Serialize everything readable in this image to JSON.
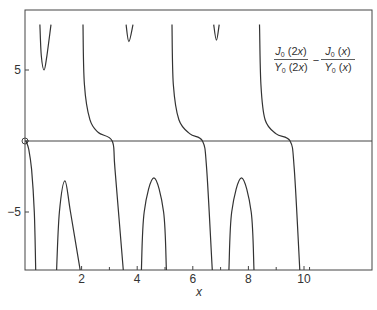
{
  "chart_data": {
    "type": "line",
    "title": "",
    "xlabel": "x",
    "ylabel": "",
    "xlim": [
      0,
      12.4
    ],
    "ylim": [
      -9.1,
      8.2
    ],
    "grid": false,
    "legend_position": "upper right (inside)",
    "x_ticks": [
      {
        "value": 2,
        "label": "2"
      },
      {
        "value": 4,
        "label": "4"
      },
      {
        "value": 6,
        "label": "6"
      },
      {
        "value": 8,
        "label": "8"
      },
      {
        "value": 10,
        "label": "10"
      }
    ],
    "x_minor_ticks": [
      3,
      5,
      7,
      9,
      10.2
    ],
    "y_ticks": [
      {
        "value": 5,
        "label": "5"
      },
      {
        "value": 0,
        "label": ""
      },
      {
        "value": -5,
        "label": "−5"
      }
    ],
    "zero_line": true,
    "origin_marker": "open-circle",
    "legend": {
      "left_fraction": {
        "numerator": "J",
        "numerator_sub": "0",
        "numerator_arg": " (2x)",
        "denominator": "Y",
        "denominator_sub": "0",
        "denominator_arg": " (2x)"
      },
      "operator": "−",
      "right_fraction": {
        "numerator": "J",
        "numerator_sub": "0",
        "numerator_arg": " (x)",
        "denominator": "Y",
        "denominator_sub": "0",
        "denominator_arg": " (x)"
      }
    },
    "series": [
      {
        "name": "J0(2x)/Y0(2x) − J0(x)/Y0(x)",
        "color": "#333333",
        "segments": [
          {
            "desc": "descending from origin to -inf",
            "points": [
              [
                0.0,
                0.0
              ],
              [
                0.1,
                -0.6
              ],
              [
                0.2,
                -2.0
              ],
              [
                0.3,
                -5.0
              ],
              [
                0.35,
                -9.1
              ]
            ]
          },
          {
            "desc": "top dip",
            "points": [
              [
                0.5,
                8.2
              ],
              [
                0.55,
                6.0
              ],
              [
                0.65,
                5.0
              ],
              [
                0.75,
                6.0
              ],
              [
                0.9,
                8.2
              ]
            ]
          },
          {
            "desc": "bottom hump 1",
            "points": [
              [
                1.1,
                -9.1
              ],
              [
                1.2,
                -5.0
              ],
              [
                1.4,
                -2.8
              ],
              [
                1.6,
                -5.0
              ],
              [
                1.95,
                -9.1
              ]
            ]
          },
          {
            "desc": "branch 1",
            "points": [
              [
                2.05,
                8.2
              ],
              [
                2.1,
                4.0
              ],
              [
                2.3,
                1.5
              ],
              [
                2.6,
                0.6
              ],
              [
                3.1,
                0.0
              ],
              [
                3.2,
                -2.0
              ],
              [
                3.5,
                -9.1
              ]
            ]
          },
          {
            "desc": "top dip 2",
            "points": [
              [
                3.6,
                8.2
              ],
              [
                3.7,
                7.0
              ],
              [
                3.85,
                8.2
              ]
            ]
          },
          {
            "desc": "bottom hump 2",
            "points": [
              [
                4.15,
                -9.1
              ],
              [
                4.25,
                -5.0
              ],
              [
                4.6,
                -2.6
              ],
              [
                4.95,
                -5.0
              ],
              [
                5.05,
                -9.1
              ]
            ]
          },
          {
            "desc": "branch 2",
            "points": [
              [
                5.25,
                8.2
              ],
              [
                5.3,
                4.0
              ],
              [
                5.5,
                1.5
              ],
              [
                5.9,
                0.5
              ],
              [
                6.35,
                0.0
              ],
              [
                6.5,
                -2.0
              ],
              [
                6.7,
                -9.1
              ]
            ]
          },
          {
            "desc": "top dip 3",
            "points": [
              [
                6.75,
                8.2
              ],
              [
                6.85,
                7.1
              ],
              [
                6.95,
                8.2
              ]
            ]
          },
          {
            "desc": "bottom hump 3",
            "points": [
              [
                7.3,
                -9.1
              ],
              [
                7.4,
                -5.0
              ],
              [
                7.75,
                -2.6
              ],
              [
                8.1,
                -5.0
              ],
              [
                8.2,
                -9.1
              ]
            ]
          },
          {
            "desc": "branch 3",
            "points": [
              [
                8.4,
                8.2
              ],
              [
                8.45,
                4.0
              ],
              [
                8.6,
                1.5
              ],
              [
                9.0,
                0.5
              ],
              [
                9.5,
                0.0
              ],
              [
                9.65,
                -2.0
              ],
              [
                9.85,
                -9.1
              ]
            ]
          }
        ]
      }
    ]
  }
}
